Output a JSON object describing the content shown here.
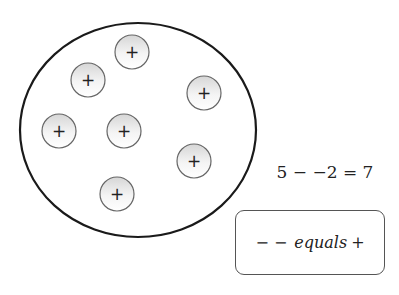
{
  "diagram": {
    "container": {
      "shape": "ellipse",
      "cx": 138,
      "cy": 130,
      "rx": 118,
      "ry": 107,
      "stroke": "#1a1a1a"
    },
    "charges": [
      {
        "id": "charge-1",
        "sign": "+",
        "cx": 132,
        "cy": 52
      },
      {
        "id": "charge-2",
        "sign": "+",
        "cx": 88,
        "cy": 80
      },
      {
        "id": "charge-3",
        "sign": "+",
        "cx": 204,
        "cy": 93
      },
      {
        "id": "charge-4",
        "sign": "+",
        "cx": 59,
        "cy": 131
      },
      {
        "id": "charge-5",
        "sign": "+",
        "cx": 124,
        "cy": 131
      },
      {
        "id": "charge-6",
        "sign": "+",
        "cx": 194,
        "cy": 161
      },
      {
        "id": "charge-7",
        "sign": "+",
        "cx": 117,
        "cy": 194
      }
    ],
    "charge_radius": 17,
    "charge_fill_top": "#dcdcdc",
    "charge_fill_bottom": "#ffffff",
    "charge_stroke": "#666666"
  },
  "equation": {
    "text": "5 − −2 = 7"
  },
  "rule": {
    "symbols": "− −",
    "word": "equals",
    "result": "+"
  }
}
